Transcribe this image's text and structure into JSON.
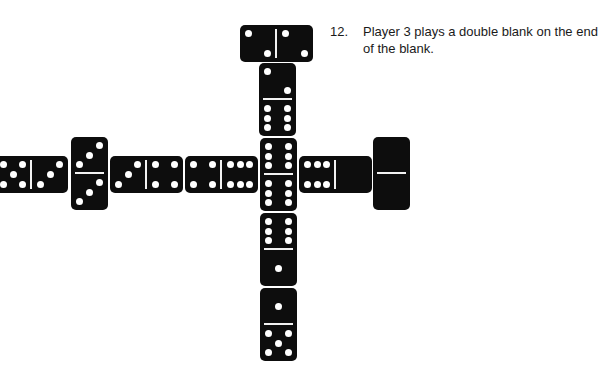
{
  "caption": {
    "number": "12.",
    "text": "Player 3 plays a double blank on the end of the blank."
  },
  "colors": {
    "tile": "#0d0d0d",
    "pip": "#ffffff",
    "background": "#ffffff"
  },
  "dominoes": [
    {
      "id": "top-double-2",
      "orientation": "h",
      "x": 240,
      "y": 25,
      "a": 2,
      "b": 2
    },
    {
      "id": "vertical-2-6",
      "orientation": "v",
      "x": 259,
      "y": 63,
      "a": 2,
      "b": 6
    },
    {
      "id": "left-5-3",
      "orientation": "h",
      "x": -5,
      "y": 156,
      "a": 5,
      "b": 3
    },
    {
      "id": "double-3",
      "orientation": "v",
      "x": 71,
      "y": 137,
      "a": 3,
      "b": 3
    },
    {
      "id": "horizontal-3-4",
      "orientation": "h",
      "x": 110,
      "y": 156,
      "a": 3,
      "b": 4
    },
    {
      "id": "horizontal-4-6",
      "orientation": "h",
      "x": 185,
      "y": 156,
      "a": 4,
      "b": 6
    },
    {
      "id": "center-double-6",
      "orientation": "v",
      "x": 260,
      "y": 138,
      "a": 6,
      "b": 6
    },
    {
      "id": "horizontal-6-0",
      "orientation": "h",
      "x": 299,
      "y": 156,
      "a": 6,
      "b": 0
    },
    {
      "id": "double-blank",
      "orientation": "v",
      "x": 373,
      "y": 137,
      "a": 0,
      "b": 0
    },
    {
      "id": "vertical-6-1",
      "orientation": "v",
      "x": 260,
      "y": 213,
      "a": 6,
      "b": 1
    },
    {
      "id": "vertical-1-5",
      "orientation": "v",
      "x": 260,
      "y": 288,
      "a": 1,
      "b": 5
    }
  ]
}
